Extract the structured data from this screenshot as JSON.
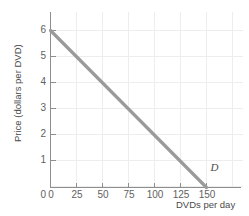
{
  "chart_data": {
    "type": "line",
    "title": "",
    "subtitle": "",
    "xlabel": "DVDs per day",
    "ylabel": "Price (dollars per DVD)",
    "xlim": [
      0,
      175
    ],
    "ylim": [
      0,
      6.6
    ],
    "xticks": [
      0,
      25,
      50,
      75,
      100,
      125,
      150
    ],
    "yticks": [
      0,
      1,
      2,
      3,
      4,
      5,
      6
    ],
    "xtick_labels": [
      "0",
      "25",
      "50",
      "75",
      "100",
      "125",
      "150"
    ],
    "ytick_labels": [
      "0",
      "1",
      "2",
      "3",
      "4",
      "5",
      "6"
    ],
    "grid": true,
    "grid_color": "#ededed",
    "legend": "none",
    "series": [
      {
        "name": "D",
        "label": "D",
        "color": "#9a9a9a",
        "type": "line",
        "points": [
          {
            "x": 0,
            "y": 6
          },
          {
            "x": 25,
            "y": 5
          },
          {
            "x": 50,
            "y": 4
          },
          {
            "x": 75,
            "y": 3
          },
          {
            "x": 100,
            "y": 2
          },
          {
            "x": 125,
            "y": 1
          },
          {
            "x": 150,
            "y": 0
          }
        ],
        "annotation": {
          "text": "D",
          "x": 152,
          "y": 0.75
        }
      }
    ],
    "axis_color": "#8e8e8e"
  },
  "axes": {
    "ylabel": "Price (dollars per DVD)",
    "xlabel": "DVDs per day"
  },
  "ticks": {
    "y": [
      "6",
      "5",
      "4",
      "3",
      "2",
      "1",
      "0"
    ],
    "x": [
      "0",
      "25",
      "50",
      "75",
      "100",
      "125",
      "150"
    ]
  },
  "annotations": {
    "demand_curve": "D"
  }
}
